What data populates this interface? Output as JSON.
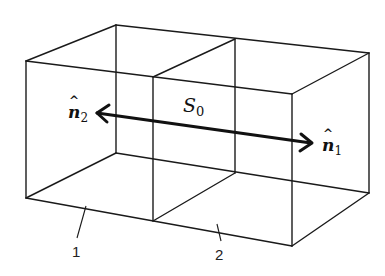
{
  "figure": {
    "surface": {
      "symbol": "S",
      "subscript": "0"
    },
    "normals": [
      {
        "symbol": "n",
        "subscript": "1",
        "direction": "right"
      },
      {
        "symbol": "n",
        "subscript": "2",
        "direction": "left"
      }
    ],
    "regions": [
      {
        "label": "1"
      },
      {
        "label": "2"
      }
    ],
    "colors": {
      "line": "#1a1a1a",
      "background": "#ffffff"
    }
  },
  "labels": {
    "n1_symbol": "n",
    "n1_sub": "1",
    "n2_symbol": "n",
    "n2_sub": "2",
    "s0_symbol": "S",
    "s0_sub": "0",
    "region1": "1",
    "region2": "2"
  }
}
